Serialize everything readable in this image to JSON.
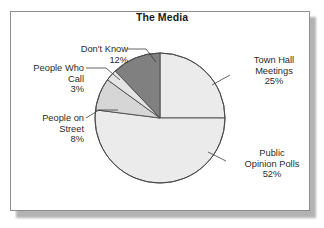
{
  "panel": {
    "background_color": "#ffffff",
    "border_color": "#8d8d8d"
  },
  "chart_data": {
    "type": "pie",
    "title": "The Media",
    "xlabel": "",
    "ylabel": "",
    "legend_position": "callout-labels",
    "grid": false,
    "start_angle_deg": 0,
    "direction": "clockwise",
    "categories": [
      "Town Hall Meetings",
      "Public Opinion Polls",
      "People on Street",
      "People Who Call",
      "Don't Know"
    ],
    "values": [
      25,
      52,
      8,
      3,
      12
    ],
    "value_unit": "%",
    "slices": [
      {
        "label_line_1": "Town Hall",
        "label_line_2": "Meetings",
        "percent_text": "25%",
        "value": 25,
        "color": "#ebebeb",
        "start_deg": 0,
        "end_deg": 90
      },
      {
        "label_line_1": "Public",
        "label_line_2": "Opinion Polls",
        "percent_text": "52%",
        "value": 52,
        "color": "#ebebeb",
        "start_deg": 90,
        "end_deg": 277.2
      },
      {
        "label_line_1": "People on",
        "label_line_2": "Street",
        "percent_text": "8%",
        "value": 8,
        "color": "#d6d6d6",
        "start_deg": 277.2,
        "end_deg": 306.0
      },
      {
        "label_line_1": "People Who",
        "label_line_2": "Call",
        "percent_text": "3%",
        "value": 3,
        "color": "#e4e4e4",
        "start_deg": 306.0,
        "end_deg": 316.8
      },
      {
        "label_line_1": "Don't Know",
        "label_line_2": "",
        "percent_text": "12%",
        "value": 12,
        "color": "#808080",
        "start_deg": 316.8,
        "end_deg": 360
      }
    ],
    "outline_color": "#4a4a4a",
    "center": {
      "x": 160,
      "y": 118
    },
    "radius": 65
  }
}
